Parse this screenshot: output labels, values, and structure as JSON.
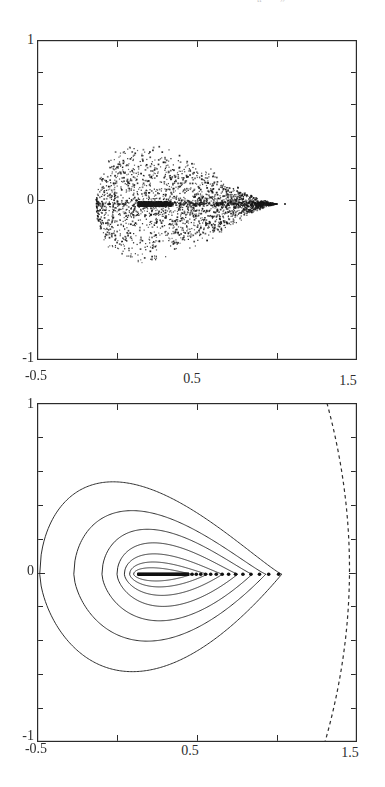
{
  "page": {
    "background": "#ffffff",
    "ink_color": "#2b2b2b",
    "caption_fragments": [
      "“",
      "”"
    ]
  },
  "chart_data": [
    {
      "id": "scatter-plot",
      "type": "scatter",
      "title": "",
      "xlabel": "",
      "ylabel": "",
      "xlim": [
        -0.5,
        1.5
      ],
      "ylim": [
        -1,
        1
      ],
      "grid": false,
      "x_tick_positions": [
        0,
        0.5,
        1.0
      ],
      "y_tick_positions": [
        -0.8,
        -0.6,
        -0.4,
        -0.2,
        0,
        0.2,
        0.4,
        0.6,
        0.8
      ],
      "x_axis_labels": [
        {
          "value": -0.5,
          "label": "-0.5"
        },
        {
          "value": 0.5,
          "label": "0.5"
        },
        {
          "value": 1.5,
          "label": "1.5"
        }
      ],
      "y_axis_labels": [
        {
          "value": 1,
          "label": "1"
        },
        {
          "value": 0,
          "label": "0"
        },
        {
          "value": -1,
          "label": "-1"
        }
      ],
      "scatter": {
        "description": "dense comet/teardrop shaped point cloud, rounded on the left, tapering to a point near x=1, centered slightly below y=0",
        "seed": 7,
        "n_cloud": 2400,
        "center_y": -0.025,
        "envelope": {
          "x_left": -0.13,
          "x_tip": 1.0,
          "max_half_height": 0.32,
          "peak_exp_a": 0.45,
          "peak_exp_b": 1.4
        },
        "center_bias_exp": 1.3,
        "dense_bar": {
          "x0": 0.135,
          "x1": 0.34,
          "half_height": 0.014,
          "n": 320
        },
        "axis_streak": {
          "x0": 0.3,
          "x1": 0.92,
          "half_height": 0.012,
          "n": 160
        },
        "tip_cluster": {
          "x": 0.9,
          "n": 50,
          "radius": 0.022
        },
        "isolated_points": [
          {
            "x": 0.97,
            "y": -0.025,
            "size": 2.4
          },
          {
            "x": 1.05,
            "y": -0.025,
            "size": 1.6
          }
        ]
      }
    },
    {
      "id": "contour-plot",
      "type": "line",
      "kind": "nested-contours",
      "title": "",
      "xlabel": "",
      "ylabel": "",
      "xlim": [
        -0.5,
        1.5
      ],
      "ylim": [
        -1,
        1
      ],
      "grid": false,
      "x_tick_positions": [
        0,
        0.5,
        1.0
      ],
      "y_tick_positions": [
        -0.8,
        -0.6,
        -0.4,
        -0.2,
        0,
        0.2,
        0.4,
        0.6,
        0.8
      ],
      "x_axis_labels": [
        {
          "value": -0.5,
          "label": "-0.5"
        },
        {
          "value": 0.5,
          "label": "0.5"
        },
        {
          "value": 1.5,
          "label": "1.5"
        }
      ],
      "y_axis_labels": [
        {
          "value": 1,
          "label": "1"
        },
        {
          "value": 0,
          "label": "0"
        },
        {
          "value": -1,
          "label": "-1"
        }
      ],
      "center_y": -0.01,
      "contours": [
        {
          "x_left": -0.483,
          "x_tip": 1.03,
          "h_top": 0.545,
          "h_bot": 0.575
        },
        {
          "x_left": -0.27,
          "x_tip": 0.93,
          "h_top": 0.375,
          "h_bot": 0.395
        },
        {
          "x_left": -0.094,
          "x_tip": 0.845,
          "h_top": 0.265,
          "h_bot": 0.275
        },
        {
          "x_left": 0.0,
          "x_tip": 0.755,
          "h_top": 0.185,
          "h_bot": 0.19
        },
        {
          "x_left": 0.046,
          "x_tip": 0.66,
          "h_top": 0.12,
          "h_bot": 0.125
        },
        {
          "x_left": 0.079,
          "x_tip": 0.565,
          "h_top": 0.072,
          "h_bot": 0.075
        },
        {
          "x_left": 0.104,
          "x_tip": 0.47,
          "h_top": 0.038,
          "h_bot": 0.04
        }
      ],
      "orbit_dots": {
        "description": "sequence of bold dots on the symmetry axis accumulating geometrically toward x=0.125 from x=1.0",
        "accumulation_x": 0.125,
        "start_x": 1.01,
        "ratio": 0.93,
        "count": 70,
        "big_dot_min_x": 0.46
      },
      "core_bar": {
        "x0": 0.128,
        "x1": 0.45
      },
      "dashed_arc": {
        "description": "dashed circular arc near right edge, bulging to x=1.45 at y=0",
        "from": [
          1.312,
          1.0
        ],
        "control": [
          1.6,
          0.0
        ],
        "to": [
          1.3,
          -1.0
        ]
      }
    }
  ]
}
